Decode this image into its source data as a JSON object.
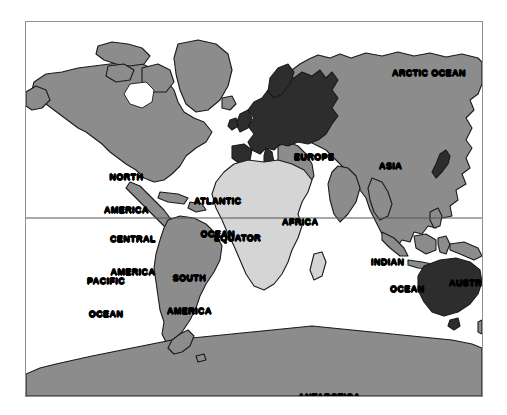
{
  "figure": {
    "kind": "world-map",
    "projection_note": "Mercator-style world map",
    "background_color": "#ffffff",
    "frame_color": "#909090"
  },
  "legend_colors": {
    "ocean": "#ffffff",
    "land_default": "#8c8c8c",
    "land_highlight_dark": "#2d2d2d",
    "land_highlight_light": "#d5d5d5",
    "coastline": "#1a1a1a",
    "equator_line": "#555555",
    "label_text": "#000000"
  },
  "continents": [
    {
      "id": "north-america",
      "label": "NORTH\nAMERICA",
      "label_lines": [
        "NORTH",
        "AMERICA"
      ],
      "shade": "land_default",
      "x": 78,
      "y": 128
    },
    {
      "id": "central-america",
      "label": "CENTRAL\nAMERICA",
      "label_lines": [
        "CENTRAL",
        "AMERICA"
      ],
      "shade": "land_default",
      "x": 84,
      "y": 190
    },
    {
      "id": "south-america",
      "label": "SOUTH\nAMERICA",
      "label_lines": [
        "SOUTH",
        "AMERICA"
      ],
      "shade": "land_default",
      "x": 141,
      "y": 229
    },
    {
      "id": "europe",
      "label": "EUROPE",
      "label_lines": [
        "EUROPE"
      ],
      "shade": "land_highlight_dark",
      "x": 268,
      "y": 130
    },
    {
      "id": "africa",
      "label": "AFRICA",
      "label_lines": [
        "AFRICA"
      ],
      "shade": "land_highlight_light",
      "x": 256,
      "y": 195
    },
    {
      "id": "asia",
      "label": "ASIA",
      "label_lines": [
        "ASIA"
      ],
      "shade": "land_default",
      "x": 353,
      "y": 139
    },
    {
      "id": "australia",
      "label": "AUSTRALIA",
      "label_lines": [
        "AUSTRALIA"
      ],
      "shade": "land_highlight_dark",
      "x": 423,
      "y": 256
    },
    {
      "id": "antarctica",
      "label": "ANTARCTICA",
      "label_lines": [
        "ANTARCTICA"
      ],
      "shade": "land_default",
      "x": 272,
      "y": 370
    }
  ],
  "oceans": [
    {
      "id": "arctic-ocean",
      "label": "ARCTIC OCEAN",
      "label_lines": [
        "ARCTIC OCEAN"
      ],
      "x": 366,
      "y": 46
    },
    {
      "id": "atlantic-ocean",
      "label": "ATLANTIC\nOCEAN",
      "label_lines": [
        "ATLANTIC",
        "OCEAN"
      ],
      "x": 168,
      "y": 152
    },
    {
      "id": "pacific-ocean",
      "label": "PACIFIC\nOCEAN",
      "label_lines": [
        "PACIFIC",
        "OCEAN"
      ],
      "x": 61,
      "y": 232
    },
    {
      "id": "indian-ocean",
      "label": "INDIAN\nOCEAN",
      "label_lines": [
        "INDIAN",
        "OCEAN"
      ],
      "x": 345,
      "y": 235
    }
  ],
  "reference_lines": [
    {
      "id": "equator",
      "label": "EQUATOR",
      "y_px": 218,
      "label_x": 188,
      "label_y": 211
    }
  ],
  "labels": {
    "north_america_l1": "NORTH",
    "north_america_l2": "AMERICA",
    "central_america_l1": "CENTRAL",
    "central_america_l2": "AMERICA",
    "south_america_l1": "SOUTH",
    "south_america_l2": "AMERICA",
    "europe": "EUROPE",
    "africa": "AFRICA",
    "asia": "ASIA",
    "australia": "AUSTRALIA",
    "antarctica": "ANTARCTICA",
    "arctic_ocean": "ARCTIC OCEAN",
    "atlantic_ocean_l1": "ATLANTIC",
    "atlantic_ocean_l2": "OCEAN",
    "pacific_ocean_l1": "PACIFIC",
    "pacific_ocean_l2": "OCEAN",
    "indian_ocean_l1": "INDIAN",
    "indian_ocean_l2": "OCEAN",
    "equator": "EQUATOR"
  }
}
